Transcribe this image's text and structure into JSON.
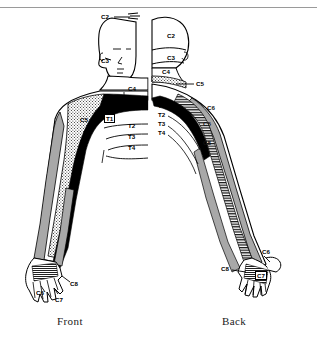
{
  "figure": {
    "type": "anatomical-dermatome-diagram",
    "captions": {
      "front": "Front",
      "back": "Back"
    },
    "front_view": {
      "name": "Front",
      "labels": [
        {
          "id": "front-c2",
          "text": "C2",
          "x": 101,
          "y": 14,
          "style": "plain"
        },
        {
          "id": "front-c3",
          "text": "C3",
          "x": 101,
          "y": 58,
          "style": "plain"
        },
        {
          "id": "front-c4",
          "text": "C4",
          "x": 128,
          "y": 86,
          "style": "plain"
        },
        {
          "id": "front-c5",
          "text": "C5",
          "x": 80,
          "y": 117,
          "style": "plain"
        },
        {
          "id": "front-t1",
          "text": "T1",
          "x": 104,
          "y": 115,
          "style": "boxed"
        },
        {
          "id": "front-t2",
          "text": "T2",
          "x": 128,
          "y": 126,
          "style": "plain"
        },
        {
          "id": "front-t3",
          "text": "T3",
          "x": 128,
          "y": 136,
          "style": "plain"
        },
        {
          "id": "front-t4",
          "text": "T4",
          "x": 128,
          "y": 146,
          "style": "plain"
        },
        {
          "id": "front-c6",
          "text": "C6",
          "x": 36,
          "y": 290,
          "style": "plain"
        },
        {
          "id": "front-c7",
          "text": "C7",
          "x": 55,
          "y": 297,
          "style": "plain"
        },
        {
          "id": "front-c8",
          "text": "C8",
          "x": 70,
          "y": 283,
          "style": "plain"
        }
      ]
    },
    "back_view": {
      "name": "Back",
      "labels": [
        {
          "id": "back-c2",
          "text": "C2",
          "x": 167,
          "y": 33,
          "style": "plain"
        },
        {
          "id": "back-c3",
          "text": "C3",
          "x": 167,
          "y": 57,
          "style": "plain"
        },
        {
          "id": "back-c4",
          "text": "C4",
          "x": 164,
          "y": 70,
          "style": "plain"
        },
        {
          "id": "back-c5-neck",
          "text": "C5",
          "x": 196,
          "y": 82,
          "style": "plain"
        },
        {
          "id": "back-t1",
          "text": "T1",
          "x": 159,
          "y": 104,
          "style": "plain"
        },
        {
          "id": "back-t2",
          "text": "T2",
          "x": 159,
          "y": 112,
          "style": "plain"
        },
        {
          "id": "back-t3",
          "text": "T3",
          "x": 159,
          "y": 122,
          "style": "plain"
        },
        {
          "id": "back-t4",
          "text": "T4",
          "x": 159,
          "y": 131,
          "style": "plain"
        },
        {
          "id": "back-c6-shoulder",
          "text": "C6",
          "x": 207,
          "y": 106,
          "style": "light"
        },
        {
          "id": "back-c5-arm",
          "text": "C5",
          "x": 203,
          "y": 122,
          "style": "light"
        },
        {
          "id": "back-c8-arm",
          "text": "C8",
          "x": 203,
          "y": 140,
          "style": "light"
        },
        {
          "id": "back-c6-hand",
          "text": "C6",
          "x": 262,
          "y": 250,
          "style": "plain"
        },
        {
          "id": "back-c8-hand",
          "text": "C8",
          "x": 222,
          "y": 268,
          "style": "plain"
        },
        {
          "id": "back-c7-hand",
          "text": "C7",
          "x": 255,
          "y": 272,
          "style": "boxed"
        }
      ]
    },
    "legend_regions": [
      {
        "key": "C5",
        "pattern": "stippled",
        "color": "#ffffff"
      },
      {
        "key": "T1",
        "pattern": "solid-black",
        "color": "#000000"
      },
      {
        "key": "C6",
        "pattern": "gray-fill",
        "color": "#a8a8a8"
      },
      {
        "key": "C7-C8",
        "pattern": "horizontal-hatch",
        "color": "#000000"
      }
    ],
    "colors": {
      "ink": "#000000",
      "gray_fill": "#a8a8a8",
      "background": "#ffffff",
      "rule": "#9a9a9a"
    }
  }
}
